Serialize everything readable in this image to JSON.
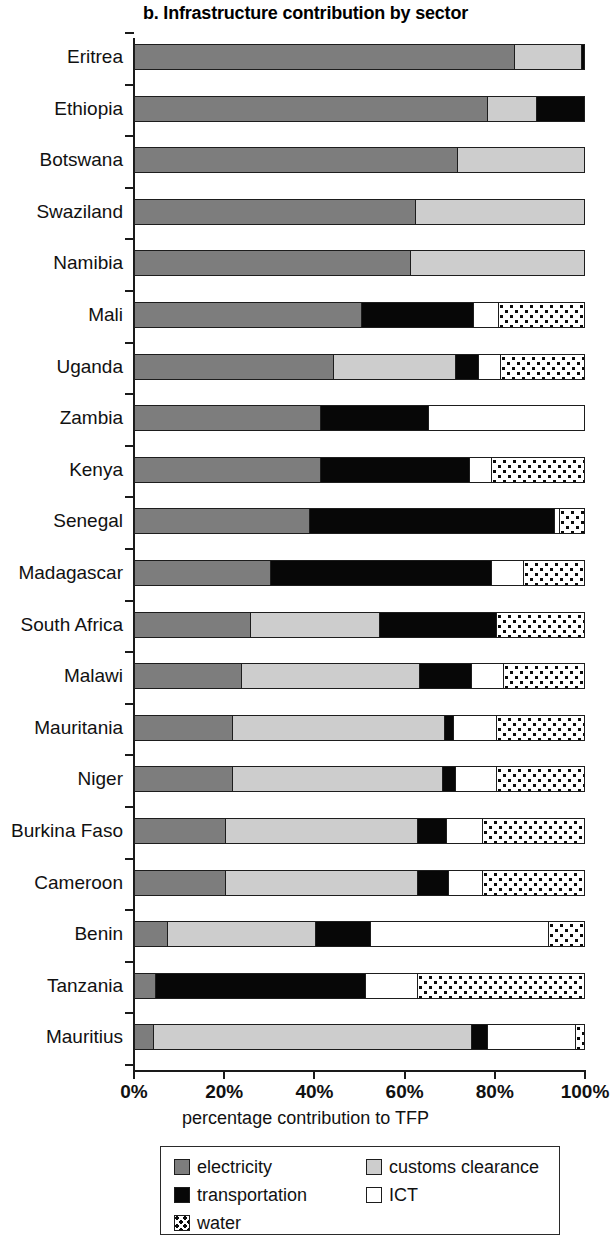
{
  "chart_data": {
    "type": "bar",
    "orientation": "horizontal",
    "stacked": true,
    "title": "b. Infrastructure contribution by sector",
    "xlabel": "percentage contribution to TFP",
    "ylabel": "",
    "xlim": [
      0,
      100
    ],
    "xticks": [
      0,
      20,
      40,
      60,
      80,
      100
    ],
    "xticklabels": [
      "0%",
      "20%",
      "40%",
      "60%",
      "80%",
      "100%"
    ],
    "grid": false,
    "legend_position": "bottom",
    "categories": [
      "Eritrea",
      "Ethiopia",
      "Botswana",
      "Swaziland",
      "Namibia",
      "Mali",
      "Uganda",
      "Zambia",
      "Kenya",
      "Senegal",
      "Madagascar",
      "South Africa",
      "Malawi",
      "Mauritania",
      "Niger",
      "Burkina Faso",
      "Cameroon",
      "Benin",
      "Tanzania",
      "Mauritius"
    ],
    "series": [
      {
        "name": "electricity",
        "color": "#7d7d7d",
        "values": [
          84,
          78,
          71.5,
          62,
          61,
          50,
          44,
          41,
          41,
          38.5,
          30,
          25.5,
          23.5,
          21.5,
          21.5,
          20,
          20,
          7,
          4.5,
          4
        ]
      },
      {
        "name": "customs clearance",
        "color": "#cdcdcd",
        "values": [
          15,
          11,
          28.5,
          38,
          39,
          0,
          27,
          0,
          0,
          0,
          0,
          28.5,
          39.5,
          47,
          46.5,
          42.5,
          42.5,
          33,
          0,
          70.5
        ]
      },
      {
        "name": "transportation",
        "color": "#070707",
        "values": [
          1,
          11,
          0,
          0,
          0,
          25,
          5,
          24,
          33,
          54.5,
          49,
          26,
          11.5,
          2,
          3,
          6.5,
          7,
          12,
          46.5,
          3.5
        ]
      },
      {
        "name": "ICT",
        "color": "#ffffff",
        "values": [
          0,
          0,
          0,
          0,
          0,
          5.5,
          5,
          35,
          5,
          1,
          7,
          0,
          7,
          9.5,
          9,
          8,
          7.5,
          39.5,
          11.5,
          19.5
        ]
      },
      {
        "name": "water",
        "color": "#ffffff-dotted",
        "values": [
          0,
          0,
          0,
          0,
          0,
          19.5,
          19,
          0,
          21,
          6,
          14,
          20,
          18.5,
          20,
          20,
          23,
          23,
          8.5,
          37.5,
          2.5
        ]
      }
    ]
  },
  "legend": {
    "items": [
      {
        "label": "electricity",
        "swatch": "electricity"
      },
      {
        "label": "transportation",
        "swatch": "transportation"
      },
      {
        "label": "water",
        "swatch": "water"
      },
      {
        "label": "customs clearance",
        "swatch": "customs"
      },
      {
        "label": "ICT",
        "swatch": "ict"
      }
    ]
  }
}
